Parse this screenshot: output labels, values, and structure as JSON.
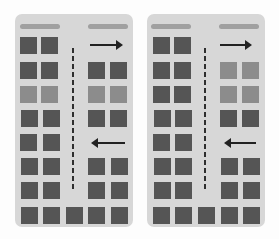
{
  "diagram": {
    "colors": {
      "panel_background": "#d7d7d7",
      "header_bar": "#a0a0a0",
      "block_dark": "#555555",
      "block_light": "#8c8c8c",
      "divider": "#2e2e2e",
      "arrow": "#222222"
    },
    "panels": [
      {
        "id": "left",
        "header_bars": 2,
        "left_column_rows": [
          "dark",
          "dark",
          "light",
          "dark",
          "dark",
          "dark",
          "dark"
        ],
        "right_column_rows": [
          "arrow-right",
          "dark",
          "light",
          "dark",
          "arrow-left",
          "dark",
          "dark"
        ],
        "bottom_row": [
          "dark",
          "dark",
          "dark",
          "dark",
          "dark"
        ]
      },
      {
        "id": "right",
        "header_bars": 2,
        "left_column_rows": [
          "dark",
          "dark",
          "dark",
          "dark",
          "dark",
          "dark",
          "dark"
        ],
        "right_column_rows": [
          "arrow-right",
          "light",
          "light",
          "dark",
          "arrow-left",
          "dark",
          "dark"
        ],
        "bottom_row": [
          "dark",
          "dark",
          "dark",
          "dark",
          "dark"
        ]
      }
    ]
  }
}
